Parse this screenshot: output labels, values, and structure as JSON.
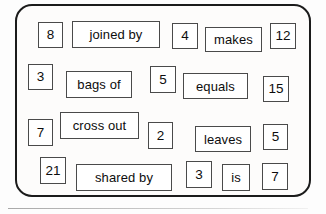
{
  "worksheet": {
    "title": "number-sentence-card",
    "border_color": "#1b1b1b",
    "box_border_color": "#4a4a4a",
    "background_color": "#fdfcfb",
    "rows": [
      {
        "id": "row-1",
        "cells": [
          {
            "text": "8",
            "kind": "number",
            "x": 38,
            "y": 22,
            "w": 25,
            "h": 26
          },
          {
            "text": "joined by",
            "kind": "word",
            "x": 72,
            "y": 21,
            "w": 88,
            "h": 27
          },
          {
            "text": "4",
            "kind": "number",
            "x": 172,
            "y": 23,
            "w": 26,
            "h": 26
          },
          {
            "text": "makes",
            "kind": "word",
            "x": 205,
            "y": 27,
            "w": 57,
            "h": 25
          },
          {
            "text": "12",
            "kind": "number",
            "x": 270,
            "y": 23,
            "w": 26,
            "h": 26
          }
        ]
      },
      {
        "id": "row-2",
        "cells": [
          {
            "text": "3",
            "kind": "number",
            "x": 28,
            "y": 64,
            "w": 25,
            "h": 26
          },
          {
            "text": "bags of",
            "kind": "word",
            "x": 66,
            "y": 71,
            "w": 66,
            "h": 27
          },
          {
            "text": "5",
            "kind": "number",
            "x": 150,
            "y": 66,
            "w": 26,
            "h": 27
          },
          {
            "text": "equals",
            "kind": "word",
            "x": 183,
            "y": 73,
            "w": 65,
            "h": 26
          },
          {
            "text": "15",
            "kind": "number",
            "x": 263,
            "y": 76,
            "w": 26,
            "h": 26
          }
        ]
      },
      {
        "id": "row-3",
        "cells": [
          {
            "text": "7",
            "kind": "number",
            "x": 28,
            "y": 119,
            "w": 25,
            "h": 27
          },
          {
            "text": "cross out",
            "kind": "word",
            "x": 60,
            "y": 112,
            "w": 79,
            "h": 27
          },
          {
            "text": "2",
            "kind": "number",
            "x": 148,
            "y": 122,
            "w": 25,
            "h": 27
          },
          {
            "text": "leaves",
            "kind": "word",
            "x": 195,
            "y": 126,
            "w": 56,
            "h": 26
          },
          {
            "text": "5",
            "kind": "number",
            "x": 263,
            "y": 124,
            "w": 25,
            "h": 26
          }
        ]
      },
      {
        "id": "row-4",
        "cells": [
          {
            "text": "21",
            "kind": "number",
            "x": 40,
            "y": 157,
            "w": 26,
            "h": 27
          },
          {
            "text": "shared by",
            "kind": "word",
            "x": 76,
            "y": 164,
            "w": 96,
            "h": 27
          },
          {
            "text": "3",
            "kind": "number",
            "x": 186,
            "y": 161,
            "w": 26,
            "h": 27
          },
          {
            "text": "is",
            "kind": "word",
            "x": 222,
            "y": 164,
            "w": 28,
            "h": 27
          },
          {
            "text": "7",
            "kind": "number",
            "x": 262,
            "y": 163,
            "w": 26,
            "h": 27
          }
        ]
      }
    ]
  }
}
